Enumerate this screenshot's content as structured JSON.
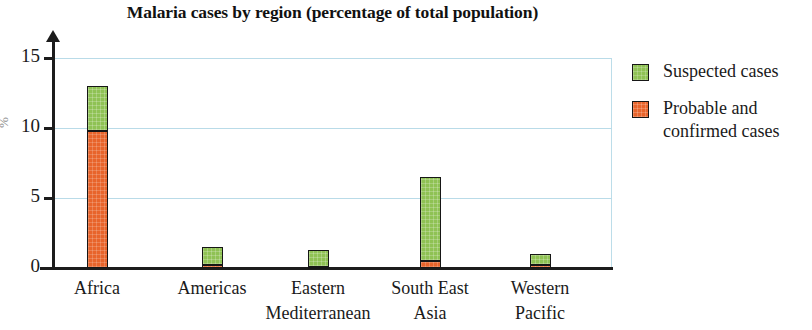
{
  "chart_data": {
    "type": "bar",
    "title": "Malaria cases by region (percentage of total population)",
    "subtitle": "",
    "xlabel": "",
    "ylabel": "%",
    "stacked": true,
    "grid": true,
    "legend_position": "right",
    "ylim": [
      0,
      15.5
    ],
    "yticks": [
      0,
      5,
      10,
      15
    ],
    "ytick_labels": [
      "0",
      "5",
      "10",
      "15"
    ],
    "categories": [
      "Africa",
      "Americas",
      "Eastern Mediterranean",
      "South East Asia",
      "Western Pacific"
    ],
    "category_lines": [
      [
        "Africa",
        ""
      ],
      [
        "Americas",
        ""
      ],
      [
        "Eastern",
        "Mediterranean"
      ],
      [
        "South East",
        "Asia"
      ],
      [
        "Western",
        "Pacific"
      ]
    ],
    "series": [
      {
        "name": "Probable and confirmed cases",
        "color": "#e8642b",
        "values": [
          9.8,
          0.2,
          0.1,
          0.5,
          0.25
        ]
      },
      {
        "name": "Suspected cases",
        "color": "#8fc254",
        "values": [
          3.2,
          1.3,
          1.2,
          6.0,
          0.75
        ]
      }
    ],
    "totals": [
      13.0,
      1.5,
      1.3,
      6.5,
      1.0
    ],
    "annotations": []
  },
  "legend": {
    "items": [
      {
        "label": "Suspected cases",
        "color": "#8fc254",
        "swatch_name": "legend-swatch-suspected"
      },
      {
        "label": "Probable and confirmed cases",
        "color": "#e8642b",
        "swatch_name": "legend-swatch-probable"
      }
    ]
  },
  "colors": {
    "suspected": "#8fc254",
    "probable": "#e8642b",
    "gridline": "#b9dbe8",
    "axis": "#1c1c1c",
    "background": "#ffffff"
  }
}
